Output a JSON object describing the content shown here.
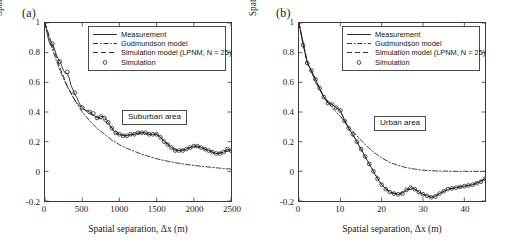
{
  "figure": {
    "background": "#ffffff",
    "line_color": "#1a1a1a",
    "axis_color": "#3a3a3a"
  },
  "panels": [
    {
      "label": "(a)",
      "annotation": "Suburban area",
      "legend": {
        "items": [
          {
            "symbol": "solid-line",
            "label": "Measurement"
          },
          {
            "symbol": "dashdot-line",
            "label": "Gudmundson model"
          },
          {
            "symbol": "dashed-line",
            "label": "Simulation model (LPNM, N = 25)"
          },
          {
            "symbol": "circle-marker",
            "label": "Simulation"
          }
        ]
      },
      "chart_data": {
        "type": "line",
        "title": "",
        "xlabel": "Spatial separation, Δx (m)",
        "ylabel": "Spatial ACF, r̂xx(Δx)",
        "xlim": [
          0,
          2500
        ],
        "ylim": [
          -0.2,
          1
        ],
        "xticks": [
          0,
          500,
          1000,
          1500,
          2000,
          2500
        ],
        "yticks": [
          1,
          0.8,
          0.6,
          0.4,
          0.2,
          0,
          -0.2
        ],
        "grid": false,
        "legend_position": "top-center",
        "series": [
          {
            "name": "Measurement",
            "style": "solid",
            "x": [
              0,
              25,
              50,
              75,
              100,
              125,
              150,
              175,
              200,
              225,
              250,
              275,
              300,
              325,
              350,
              375,
              400,
              425,
              450,
              475,
              500,
              525,
              550,
              575,
              600,
              625,
              650,
              675,
              700,
              725,
              750,
              775,
              800,
              825,
              850,
              875,
              900,
              925,
              950,
              975,
              1000,
              1050,
              1100,
              1150,
              1200,
              1250,
              1300,
              1350,
              1400,
              1450,
              1500,
              1550,
              1600,
              1650,
              1700,
              1750,
              1800,
              1850,
              1900,
              1950,
              2000,
              2050,
              2100,
              2150,
              2200,
              2250,
              2300,
              2350,
              2400,
              2450,
              2500
            ],
            "y": [
              1.0,
              0.94,
              0.88,
              0.85,
              0.86,
              0.83,
              0.79,
              0.76,
              0.74,
              0.71,
              0.68,
              0.66,
              0.66,
              0.63,
              0.58,
              0.55,
              0.52,
              0.5,
              0.47,
              0.45,
              0.43,
              0.42,
              0.41,
              0.41,
              0.4,
              0.39,
              0.38,
              0.37,
              0.36,
              0.36,
              0.37,
              0.37,
              0.36,
              0.35,
              0.33,
              0.31,
              0.29,
              0.27,
              0.26,
              0.25,
              0.25,
              0.24,
              0.24,
              0.25,
              0.25,
              0.26,
              0.26,
              0.26,
              0.25,
              0.25,
              0.25,
              0.23,
              0.2,
              0.18,
              0.16,
              0.14,
              0.14,
              0.14,
              0.15,
              0.16,
              0.17,
              0.17,
              0.16,
              0.15,
              0.14,
              0.13,
              0.12,
              0.12,
              0.13,
              0.15,
              0.14
            ]
          },
          {
            "name": "Gudmundson model",
            "style": "dashdot",
            "x": [
              0,
              100,
              200,
              300,
              400,
              500,
              600,
              700,
              800,
              900,
              1000,
              1100,
              1200,
              1300,
              1400,
              1500,
              1600,
              1700,
              1800,
              1900,
              2000,
              2100,
              2200,
              2300,
              2400,
              2500
            ],
            "y": [
              1.0,
              0.82,
              0.68,
              0.57,
              0.48,
              0.4,
              0.34,
              0.29,
              0.25,
              0.21,
              0.18,
              0.155,
              0.135,
              0.115,
              0.1,
              0.085,
              0.073,
              0.063,
              0.054,
              0.046,
              0.04,
              0.034,
              0.029,
              0.024,
              0.019,
              0.015
            ]
          },
          {
            "name": "Simulation model (LPNM, N = 25)",
            "style": "dashed",
            "x": [
              0,
              100,
              200,
              300,
              400,
              500,
              600,
              700,
              800,
              900,
              1000,
              1100,
              1200,
              1300,
              1400,
              1500,
              1600,
              1700,
              1800,
              1900,
              2000,
              2100,
              2200,
              2300,
              2400,
              2500
            ],
            "y": [
              1.0,
              0.845,
              0.7,
              0.575,
              0.48,
              0.425,
              0.39,
              0.365,
              0.34,
              0.29,
              0.25,
              0.24,
              0.25,
              0.26,
              0.25,
              0.25,
              0.21,
              0.16,
              0.14,
              0.15,
              0.17,
              0.16,
              0.14,
              0.12,
              0.13,
              0.14
            ]
          },
          {
            "name": "Simulation",
            "style": "circles",
            "x": [
              100,
              200,
              300,
              400,
              500,
              600,
              650,
              700,
              750,
              800,
              850,
              900,
              950,
              1000,
              1050,
              1100,
              1150,
              1200,
              1250,
              1300,
              1350,
              1400,
              1450,
              1500,
              1550,
              1600,
              1650,
              1700,
              1750,
              1800,
              1850,
              1900,
              1950,
              2000,
              2050,
              2100,
              2150,
              2200,
              2250,
              2300,
              2350,
              2400,
              2450,
              2500
            ],
            "y": [
              0.86,
              0.74,
              0.67,
              0.53,
              0.43,
              0.4,
              0.39,
              0.36,
              0.37,
              0.36,
              0.33,
              0.29,
              0.26,
              0.25,
              0.24,
              0.24,
              0.25,
              0.25,
              0.26,
              0.26,
              0.26,
              0.25,
              0.25,
              0.25,
              0.23,
              0.2,
              0.18,
              0.16,
              0.14,
              0.14,
              0.14,
              0.15,
              0.16,
              0.17,
              0.17,
              0.16,
              0.15,
              0.14,
              0.13,
              0.12,
              0.12,
              0.13,
              0.15,
              0.14
            ]
          }
        ]
      }
    },
    {
      "label": "(b)",
      "annotation": "Urban area",
      "legend": {
        "items": [
          {
            "symbol": "solid-line",
            "label": "Measurement"
          },
          {
            "symbol": "dashdot-line",
            "label": "Gudmundson model"
          },
          {
            "symbol": "dashed-line",
            "label": "Simulation model (LPNM, N = 25)"
          },
          {
            "symbol": "circle-marker",
            "label": "Simulation"
          }
        ]
      },
      "chart_data": {
        "type": "line",
        "title": "",
        "xlabel": "Spatial separation, Δx (m)",
        "ylabel": "Spatial ACF, r̂xx(Δx)",
        "xlim": [
          0,
          45
        ],
        "ylim": [
          -0.2,
          1
        ],
        "xticks": [
          0,
          10,
          20,
          30,
          40
        ],
        "yticks": [
          1,
          0.8,
          0.6,
          0.4,
          0.2,
          0,
          -0.2
        ],
        "grid": false,
        "legend_position": "top-center",
        "series": [
          {
            "name": "Measurement",
            "style": "solid",
            "x": [
              0,
              1,
              2,
              3,
              4,
              5,
              6,
              7,
              8,
              9,
              10,
              11,
              12,
              13,
              14,
              15,
              16,
              17,
              18,
              19,
              20,
              21,
              22,
              23,
              24,
              25,
              26,
              27,
              28,
              29,
              30,
              31,
              32,
              33,
              34,
              35,
              36,
              37,
              38,
              39,
              40,
              41,
              42,
              43,
              44,
              45
            ],
            "y": [
              1.0,
              0.85,
              0.73,
              0.68,
              0.62,
              0.56,
              0.5,
              0.46,
              0.45,
              0.43,
              0.41,
              0.34,
              0.29,
              0.25,
              0.2,
              0.15,
              0.1,
              0.05,
              0.0,
              -0.05,
              -0.09,
              -0.12,
              -0.14,
              -0.15,
              -0.155,
              -0.15,
              -0.125,
              -0.11,
              -0.12,
              -0.14,
              -0.155,
              -0.165,
              -0.175,
              -0.17,
              -0.15,
              -0.135,
              -0.12,
              -0.115,
              -0.11,
              -0.105,
              -0.1,
              -0.095,
              -0.09,
              -0.08,
              -0.07,
              -0.05
            ]
          },
          {
            "name": "Gudmundson model",
            "style": "dashdot",
            "x": [
              0,
              2,
              4,
              6,
              8,
              10,
              12,
              14,
              16,
              18,
              20,
              22,
              24,
              26,
              28,
              30,
              32,
              34,
              36,
              38,
              40,
              42,
              45
            ],
            "y": [
              1.0,
              0.74,
              0.6,
              0.5,
              0.43,
              0.37,
              0.3,
              0.24,
              0.18,
              0.13,
              0.09,
              0.06,
              0.04,
              0.025,
              0.015,
              0.008,
              0.004,
              0.002,
              0.001,
              0.0,
              0.0,
              0.0,
              0.0
            ]
          },
          {
            "name": "Simulation model (LPNM, N = 25)",
            "style": "dashed",
            "x": [
              0,
              2,
              4,
              6,
              8,
              10,
              12,
              14,
              16,
              18,
              20,
              22,
              24,
              26,
              28,
              30,
              32,
              34,
              36,
              38,
              40,
              42,
              45
            ],
            "y": [
              1.0,
              0.73,
              0.62,
              0.5,
              0.45,
              0.41,
              0.29,
              0.2,
              0.1,
              0.0,
              -0.09,
              -0.14,
              -0.155,
              -0.125,
              -0.12,
              -0.155,
              -0.175,
              -0.15,
              -0.12,
              -0.11,
              -0.1,
              -0.09,
              -0.05
            ]
          },
          {
            "name": "Simulation",
            "style": "circles",
            "x": [
              1,
              2,
              3,
              4,
              5,
              6,
              7,
              8,
              9,
              10,
              11,
              12,
              13,
              14,
              15,
              16,
              17,
              18,
              19,
              20,
              21,
              22,
              23,
              24,
              25,
              26,
              27,
              28,
              29,
              30,
              31,
              32,
              33,
              34,
              35,
              36,
              37,
              38,
              39,
              40,
              41,
              42,
              43,
              44,
              45
            ],
            "y": [
              0.85,
              0.73,
              0.68,
              0.62,
              0.56,
              0.5,
              0.46,
              0.45,
              0.43,
              0.41,
              0.34,
              0.29,
              0.25,
              0.2,
              0.15,
              0.1,
              0.05,
              0.0,
              -0.05,
              -0.09,
              -0.12,
              -0.14,
              -0.15,
              -0.155,
              -0.15,
              -0.125,
              -0.11,
              -0.12,
              -0.14,
              -0.155,
              -0.165,
              -0.175,
              -0.17,
              -0.15,
              -0.135,
              -0.12,
              -0.115,
              -0.11,
              -0.105,
              -0.1,
              -0.095,
              -0.09,
              -0.08,
              -0.07,
              -0.05
            ]
          }
        ]
      }
    }
  ]
}
